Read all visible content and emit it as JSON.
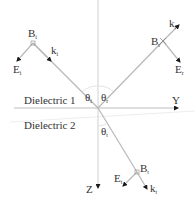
{
  "diagram": {
    "title": "",
    "colors": {
      "ray": "#b8b8b8",
      "axis": "#c8c8c8",
      "arrow": "#1a1a1a",
      "text": "#333333",
      "arc": "#e0e0e0"
    },
    "regions": {
      "upper": "Dielectric 1",
      "lower": "Dielectric 2"
    },
    "axes": {
      "horizontal": "Y",
      "vertical": "Z"
    },
    "angles": {
      "incident": {
        "symbol": "θ",
        "sub": "i"
      },
      "reflected": {
        "symbol": "θ",
        "sub": "r"
      },
      "transmitted": {
        "symbol": "θ",
        "sub": "t"
      }
    },
    "waves": {
      "incident": {
        "B": {
          "symbol": "B",
          "sub": "i"
        },
        "k": {
          "symbol": "k",
          "sub": "i"
        },
        "E": {
          "symbol": "E",
          "sub": "i"
        }
      },
      "reflected": {
        "B": {
          "symbol": "B",
          "sub": "r"
        },
        "k": {
          "symbol": "k",
          "sub": "r"
        },
        "E": {
          "symbol": "E",
          "sub": "r"
        }
      },
      "transmitted": {
        "B": {
          "symbol": "B",
          "sub": "t"
        },
        "k": {
          "symbol": "k",
          "sub": "t"
        },
        "E": {
          "symbol": "E",
          "sub": "t"
        }
      }
    }
  }
}
